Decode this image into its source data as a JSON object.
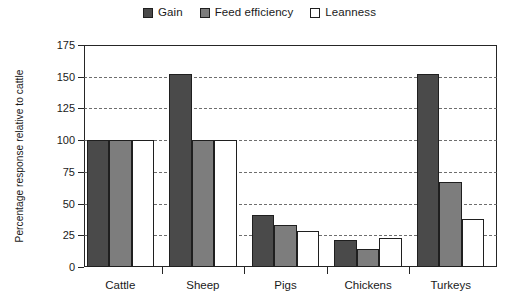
{
  "chart_data": {
    "type": "bar",
    "title": "",
    "xlabel": "",
    "ylabel": "Percentage response relative to cattle",
    "ylim": [
      0,
      175
    ],
    "yticks": [
      0,
      25,
      50,
      75,
      100,
      125,
      150,
      175
    ],
    "grid": true,
    "legend_position": "top-center",
    "categories": [
      "Cattle",
      "Sheep",
      "Pigs",
      "Chickens",
      "Turkeys"
    ],
    "series": [
      {
        "name": "Gain",
        "color": "#4a4a4a",
        "values": [
          100,
          152,
          41,
          21,
          152
        ]
      },
      {
        "name": "Feed efficiency",
        "color": "#7d7d7d",
        "values": [
          100,
          100,
          33,
          14,
          67
        ]
      },
      {
        "name": "Leanness",
        "color": "#ffffff",
        "values": [
          100,
          100,
          28,
          23,
          38
        ]
      }
    ]
  },
  "legend": {
    "entries": [
      {
        "label": "Gain"
      },
      {
        "label": "Feed efficiency"
      },
      {
        "label": "Leanness"
      }
    ]
  },
  "axis": {
    "y_title": "Percentage response relative to cattle"
  },
  "colors": {
    "gain": "#4a4a4a",
    "feed_efficiency": "#7d7d7d",
    "leanness": "#ffffff",
    "outline": "#1f1f1f",
    "frame": "#262626",
    "grid": "#555555"
  }
}
